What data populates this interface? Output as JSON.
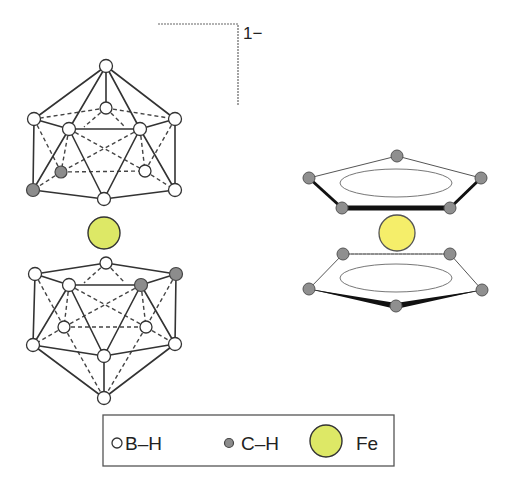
{
  "figure": {
    "charge_label": "1−",
    "left_structure": "metallacarborane sandwich [Fe(C2B9H11)2]-",
    "right_structure": "ferrocene sandwich Fe(C5H5)2"
  },
  "legend": {
    "items": [
      {
        "symbol": "white-circle",
        "label": "B–H",
        "color": "#ffffff"
      },
      {
        "symbol": "gray-circle",
        "label": "C–H",
        "color": "#8c8c8c"
      },
      {
        "symbol": "yellow-circle",
        "label": "Fe",
        "color": "#dde866"
      }
    ]
  },
  "colors": {
    "fe_carborane": "#dde866",
    "fe_ferrocene": "#f5ee6a",
    "carbon": "#8c8c8c",
    "boron": "#ffffff"
  }
}
